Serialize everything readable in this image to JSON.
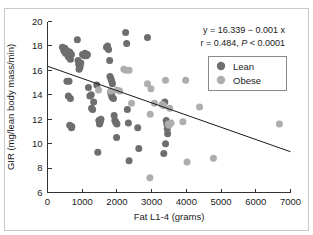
{
  "chart_data": {
    "type": "scatter",
    "title": "",
    "xlabel": "Fat L1-4 (grams)",
    "ylabel": "GIR (mg/lean body mass/min)",
    "xlim": [
      0,
      7000
    ],
    "ylim": [
      6,
      20
    ],
    "xticks": [
      0,
      1000,
      2000,
      3000,
      4000,
      5000,
      6000,
      7000
    ],
    "yticks": [
      6,
      8,
      10,
      12,
      14,
      16,
      18,
      20
    ],
    "xticklabels": [
      "0",
      "1000",
      "2000",
      "3000",
      "4000",
      "5000",
      "6000",
      "7000"
    ],
    "yticklabels": [
      "6",
      "8",
      "10",
      "12",
      "14",
      "16",
      "18",
      "20"
    ],
    "grid": false,
    "legend_position": "upper-right",
    "annotations": [
      "y = 16.339 − 0.001 x",
      "r = 0.484, P < 0.0001"
    ],
    "annotation_parts": {
      "equation": "y = 16.339 − 0.001 x",
      "correlation_prefix": "r = 0.484, ",
      "p_symbol": "P",
      "p_value": " < 0.0001"
    },
    "trendline": {
      "intercept": 16.339,
      "slope": -0.001,
      "x_start": 0,
      "x_end": 7000,
      "y_start": 16.339,
      "y_end": 9.339,
      "color": "#1a1a1a"
    },
    "series": [
      {
        "name": "Lean",
        "color": "#6e6e6e",
        "points": [
          [
            430,
            17.9
          ],
          [
            470,
            17.6
          ],
          [
            500,
            17.8
          ],
          [
            520,
            17.4
          ],
          [
            560,
            17.6
          ],
          [
            590,
            17.2
          ],
          [
            610,
            17.1
          ],
          [
            640,
            17.5
          ],
          [
            660,
            16.9
          ],
          [
            690,
            17.3
          ],
          [
            560,
            15.1
          ],
          [
            620,
            15.1
          ],
          [
            600,
            13.9
          ],
          [
            660,
            13.7
          ],
          [
            640,
            11.5
          ],
          [
            700,
            11.4
          ],
          [
            690,
            11.3
          ],
          [
            860,
            18.5
          ],
          [
            880,
            16.8
          ],
          [
            900,
            16.5
          ],
          [
            920,
            16.4
          ],
          [
            910,
            16.1
          ],
          [
            940,
            16.3
          ],
          [
            960,
            16.6
          ],
          [
            1010,
            17.3
          ],
          [
            1060,
            17.2
          ],
          [
            1080,
            17.4
          ],
          [
            1120,
            17.2
          ],
          [
            1150,
            17.3
          ],
          [
            1180,
            14.6
          ],
          [
            1220,
            13.9
          ],
          [
            1260,
            14.0
          ],
          [
            1270,
            12.9
          ],
          [
            1300,
            12.8
          ],
          [
            1330,
            13.4
          ],
          [
            1420,
            14.8
          ],
          [
            1450,
            9.3
          ],
          [
            1480,
            11.9
          ],
          [
            1500,
            11.6
          ],
          [
            1520,
            11.8
          ],
          [
            1540,
            12.0
          ],
          [
            1700,
            17.9
          ],
          [
            1730,
            18.0
          ],
          [
            1760,
            17.7
          ],
          [
            1790,
            16.8
          ],
          [
            1800,
            15.5
          ],
          [
            1830,
            15.3
          ],
          [
            1850,
            15.1
          ],
          [
            1870,
            14.9
          ],
          [
            1820,
            14.2
          ],
          [
            1840,
            14.0
          ],
          [
            1860,
            13.8
          ],
          [
            1900,
            13.7
          ],
          [
            1920,
            12.3
          ],
          [
            1940,
            11.9
          ],
          [
            1960,
            11.8
          ],
          [
            1980,
            11.7
          ],
          [
            2000,
            11.6
          ],
          [
            1990,
            10.5
          ],
          [
            2250,
            19.1
          ],
          [
            2280,
            18.2
          ],
          [
            2300,
            12.8
          ],
          [
            2330,
            11.7
          ],
          [
            2350,
            8.6
          ],
          [
            2600,
            11.3
          ],
          [
            2630,
            9.6
          ],
          [
            2880,
            18.7
          ],
          [
            3380,
            13.4
          ],
          [
            3420,
            11.9
          ],
          [
            3440,
            11.6
          ],
          [
            3450,
            11.2
          ],
          [
            3460,
            10.8
          ],
          [
            3400,
            10.0
          ],
          [
            3350,
            9.2
          ]
        ]
      },
      {
        "name": "Obese",
        "color": "#aeaeae",
        "points": [
          [
            1470,
            14.4
          ],
          [
            1820,
            14.3
          ],
          [
            2000,
            14.4
          ],
          [
            2080,
            14.3
          ],
          [
            2200,
            16.1
          ],
          [
            2260,
            16.0
          ],
          [
            2350,
            16.0
          ],
          [
            2420,
            13.3
          ],
          [
            2880,
            14.9
          ],
          [
            2980,
            14.5
          ],
          [
            2960,
            12.4
          ],
          [
            2950,
            7.2
          ],
          [
            3080,
            13.3
          ],
          [
            3300,
            13.2
          ],
          [
            3350,
            13.1
          ],
          [
            3400,
            15.2
          ],
          [
            3480,
            11.6
          ],
          [
            3500,
            11.5
          ],
          [
            3520,
            12.9
          ],
          [
            3560,
            11.7
          ],
          [
            3900,
            11.8
          ],
          [
            3980,
            15.2
          ],
          [
            4020,
            8.5
          ],
          [
            4380,
            13.0
          ],
          [
            4780,
            8.8
          ],
          [
            6680,
            11.6
          ]
        ]
      }
    ]
  },
  "legend": {
    "entries": [
      {
        "label": "Lean",
        "color": "#6e6e6e"
      },
      {
        "label": "Obese",
        "color": "#aeaeae"
      }
    ]
  }
}
